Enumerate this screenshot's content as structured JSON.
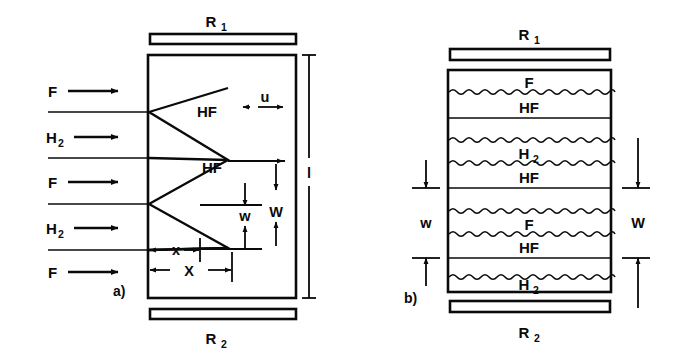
{
  "figure": {
    "type": "scientific-diagram",
    "background_color": "#ffffff",
    "line_color": "#0a0a0a"
  },
  "panel_a": {
    "key": "a)",
    "mirror_top_label": "R",
    "mirror_top_sub": "1",
    "mirror_bottom_label": "R",
    "mirror_bottom_sub": "2",
    "cavity_length_label": "l",
    "flow_velocity_label": "u",
    "inlets": [
      {
        "label": "F",
        "sub": ""
      },
      {
        "label": "H",
        "sub": "2"
      },
      {
        "label": "F",
        "sub": ""
      },
      {
        "label": "H",
        "sub": "2"
      },
      {
        "label": "F",
        "sub": ""
      }
    ],
    "reaction_zone_labels": [
      "HF",
      "HF"
    ],
    "dimensions": [
      {
        "name": "x-small",
        "label": "x"
      },
      {
        "name": "X-large",
        "label": "X"
      },
      {
        "name": "w-small",
        "label": "w"
      },
      {
        "name": "W-large",
        "label": "W"
      }
    ]
  },
  "panel_b": {
    "key": "b)",
    "mirror_top_label": "R",
    "mirror_top_sub": "1",
    "mirror_bottom_label": "R",
    "mirror_bottom_sub": "2",
    "layers": [
      {
        "label": "F",
        "sub": "",
        "divider": "wavy"
      },
      {
        "label": "HF",
        "sub": "",
        "divider": "flat"
      },
      {
        "label": "",
        "sub": "",
        "divider": "wavy"
      },
      {
        "label": "H",
        "sub": "2",
        "divider": "wavy"
      },
      {
        "label": "HF",
        "sub": "",
        "divider": "flat"
      },
      {
        "label": "",
        "sub": "",
        "divider": "wavy"
      },
      {
        "label": "F",
        "sub": "",
        "divider": "wavy"
      },
      {
        "label": "HF",
        "sub": "",
        "divider": "flat"
      },
      {
        "label": "",
        "sub": "",
        "divider": "wavy"
      },
      {
        "label": "H",
        "sub": "2",
        "divider": "none"
      }
    ],
    "dimensions": [
      {
        "name": "w-small",
        "label": "w"
      },
      {
        "name": "W-large",
        "label": "W"
      }
    ]
  }
}
